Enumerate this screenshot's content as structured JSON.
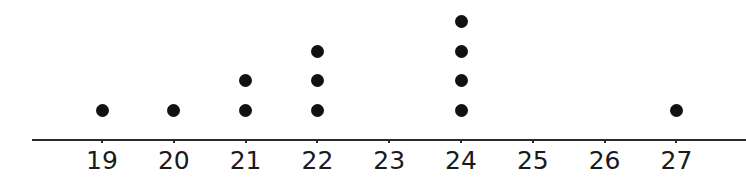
{
  "chart_data": {
    "type": "dot",
    "title": "",
    "xlabel": "",
    "ylabel": "",
    "categories": [
      "19",
      "20",
      "21",
      "22",
      "23",
      "24",
      "25",
      "26",
      "27"
    ],
    "values": [
      1,
      1,
      2,
      3,
      0,
      4,
      0,
      0,
      1
    ],
    "xlim": [
      19,
      27
    ],
    "grid": false,
    "legend": null,
    "dot_color": "#111111",
    "axis_color": "#2a2a2a"
  }
}
